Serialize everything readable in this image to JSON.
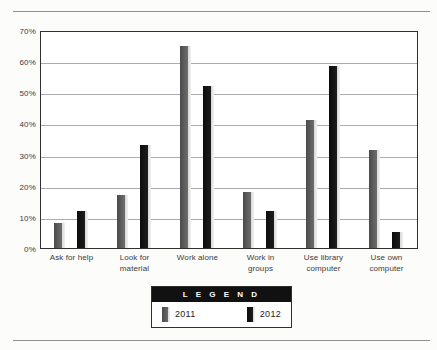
{
  "chart_data": {
    "type": "bar",
    "title": "",
    "xlabel": "",
    "ylabel": "",
    "ylim": [
      0,
      70
    ],
    "grid": true,
    "legend_position": "bottom-center",
    "legend_title": "L E G E N D",
    "categories": [
      "Ask for help",
      "Look for material",
      "Work alone",
      "Work in groups",
      "Use library computer",
      "Use own computer"
    ],
    "category_lines": [
      [
        "Ask for help"
      ],
      [
        "Look for",
        "material"
      ],
      [
        "Work alone"
      ],
      [
        "Work in",
        "groups"
      ],
      [
        "Use library",
        "computer"
      ],
      [
        "Use own",
        "computer"
      ]
    ],
    "ytick_labels": [
      "70%",
      "60%",
      "50%",
      "40%",
      "30%",
      "20%",
      "10%",
      "0%"
    ],
    "ytick_values": [
      70,
      60,
      50,
      40,
      30,
      20,
      10,
      0
    ],
    "series": [
      {
        "name": "2011",
        "color": "#5e5e5e",
        "values": [
          8,
          17,
          65,
          18,
          41,
          31.5
        ]
      },
      {
        "name": "2012",
        "color": "#111111",
        "values": [
          12,
          33,
          52,
          12,
          58.5,
          5
        ]
      }
    ]
  }
}
